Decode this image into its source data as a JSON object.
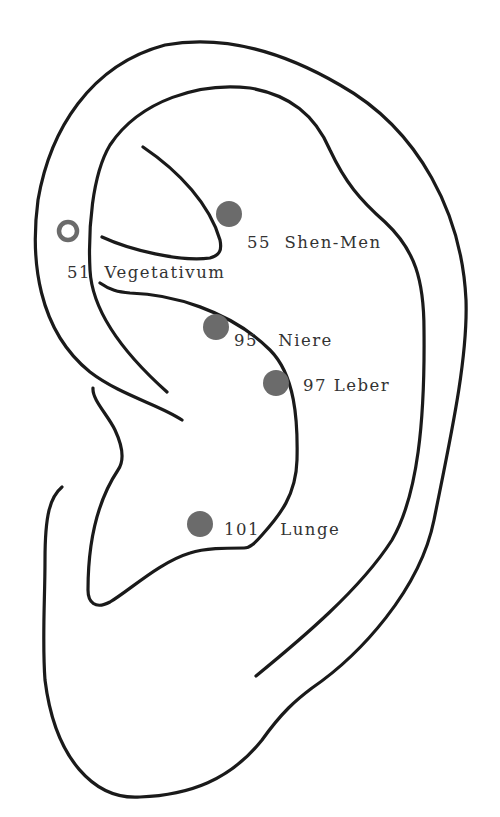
{
  "diagram": {
    "colors": {
      "outline": "#1a1a1a",
      "point_fill": "#6b6b6b",
      "open_point_stroke": "#6b6b6b",
      "label_text": "#333333"
    },
    "points": [
      {
        "id": "51",
        "name": "Vegetativum",
        "label": "51  Vegetativum",
        "style": "open",
        "cx": 68,
        "cy": 231,
        "lx": 67,
        "ly": 278
      },
      {
        "id": "55",
        "name": "Shen-Men",
        "label": "55  Shen-Men",
        "style": "filled",
        "cx": 229,
        "cy": 214,
        "lx": 247,
        "ly": 248
      },
      {
        "id": "95",
        "name": "Niere",
        "label": "95   Niere",
        "style": "filled",
        "cx": 216,
        "cy": 327,
        "lx": 234,
        "ly": 346
      },
      {
        "id": "97",
        "name": "Leber",
        "label": "97 Leber",
        "style": "filled",
        "cx": 276,
        "cy": 383,
        "lx": 303,
        "ly": 391
      },
      {
        "id": "101",
        "name": "Lunge",
        "label": "101   Lunge",
        "style": "filled",
        "cx": 200,
        "cy": 524,
        "lx": 224,
        "ly": 535
      }
    ]
  }
}
